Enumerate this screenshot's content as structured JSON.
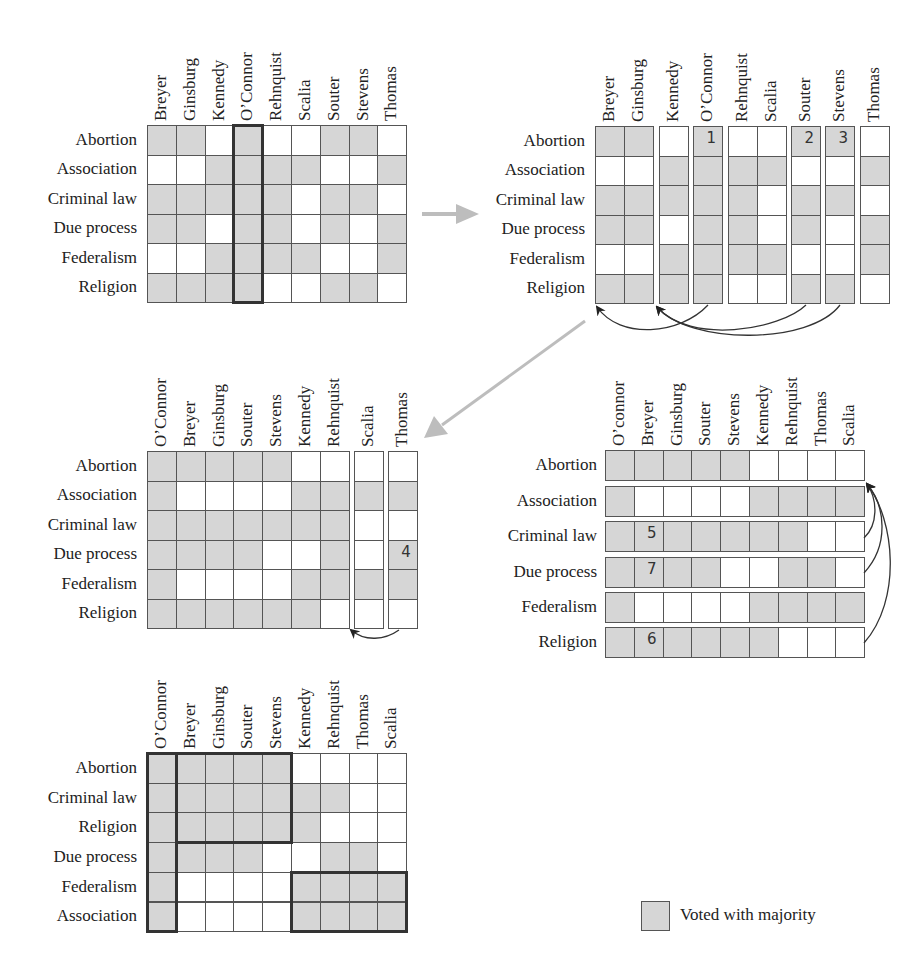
{
  "colors": {
    "majority": "#d6d6d6",
    "minority": "#ffffff",
    "grid": "#555555",
    "flow_arrow": "#b8b8b8",
    "link_arrow": "#333333"
  },
  "legend": {
    "label": "Voted with majority",
    "swatch": "majority"
  },
  "matrices": [
    {
      "id": "step1-original",
      "columns": [
        "Breyer",
        "Ginsburg",
        "Kennedy",
        "O’Connor",
        "Rehnquist",
        "Scalia",
        "Souter",
        "Stevens",
        "Thomas"
      ],
      "rows": [
        "Abortion",
        "Association",
        "Criminal law",
        "Due process",
        "Federalism",
        "Religion"
      ],
      "cells": [
        [
          1,
          1,
          0,
          1,
          0,
          0,
          1,
          1,
          0
        ],
        [
          0,
          0,
          1,
          1,
          1,
          1,
          0,
          0,
          1
        ],
        [
          1,
          1,
          1,
          1,
          1,
          0,
          1,
          1,
          0
        ],
        [
          1,
          1,
          0,
          1,
          1,
          0,
          1,
          0,
          1
        ],
        [
          0,
          0,
          1,
          1,
          1,
          1,
          0,
          0,
          1
        ],
        [
          1,
          1,
          1,
          1,
          0,
          0,
          1,
          1,
          0
        ]
      ],
      "highlight": "O’Connor column"
    },
    {
      "id": "step2-split-columns",
      "columns": [
        "Breyer",
        "Ginsburg",
        "Kennedy",
        "O’Connor",
        "Rehnquist",
        "Scalia",
        "Souter",
        "Stevens",
        "Thomas"
      ],
      "column_groups": [
        [
          "Breyer",
          "Ginsburg"
        ],
        [
          "Kennedy"
        ],
        [
          "O’Connor"
        ],
        [
          "Rehnquist",
          "Scalia"
        ],
        [
          "Souter"
        ],
        [
          "Stevens"
        ],
        [
          "Thomas"
        ]
      ],
      "rows": [
        "Abortion",
        "Association",
        "Criminal law",
        "Due process",
        "Federalism",
        "Religion"
      ],
      "cells": [
        [
          1,
          1,
          0,
          1,
          0,
          0,
          1,
          1,
          0
        ],
        [
          0,
          0,
          1,
          1,
          1,
          1,
          0,
          0,
          1
        ],
        [
          1,
          1,
          1,
          1,
          1,
          0,
          1,
          1,
          0
        ],
        [
          1,
          1,
          0,
          1,
          1,
          0,
          1,
          0,
          1
        ],
        [
          0,
          0,
          1,
          1,
          1,
          1,
          0,
          0,
          1
        ],
        [
          1,
          1,
          1,
          1,
          0,
          0,
          1,
          1,
          0
        ]
      ],
      "markers": [
        {
          "label": "1",
          "row": 0,
          "col": 3
        },
        {
          "label": "2",
          "row": 0,
          "col": 6
        },
        {
          "label": "3",
          "row": 0,
          "col": 7
        }
      ]
    },
    {
      "id": "step3-reordered-columns",
      "columns": [
        "O’Connor",
        "Breyer",
        "Ginsburg",
        "Souter",
        "Stevens",
        "Kennedy",
        "Rehnquist",
        "Scalia",
        "Thomas"
      ],
      "column_groups": [
        [
          "O’Connor",
          "Breyer",
          "Ginsburg",
          "Souter",
          "Stevens",
          "Kennedy",
          "Rehnquist"
        ],
        [
          "Scalia"
        ],
        [
          "Thomas"
        ]
      ],
      "rows": [
        "Abortion",
        "Association",
        "Criminal law",
        "Due process",
        "Federalism",
        "Religion"
      ],
      "cells": [
        [
          1,
          1,
          1,
          1,
          1,
          0,
          0,
          0,
          0
        ],
        [
          1,
          0,
          0,
          0,
          0,
          1,
          1,
          1,
          1
        ],
        [
          1,
          1,
          1,
          1,
          1,
          1,
          1,
          0,
          0
        ],
        [
          1,
          1,
          1,
          1,
          0,
          0,
          1,
          0,
          1
        ],
        [
          1,
          0,
          0,
          0,
          0,
          1,
          1,
          1,
          1
        ],
        [
          1,
          1,
          1,
          1,
          1,
          1,
          0,
          0,
          0
        ]
      ],
      "markers": [
        {
          "label": "4",
          "row": 3,
          "col": 8
        }
      ]
    },
    {
      "id": "step4-split-rows",
      "columns": [
        "O’connor",
        "Breyer",
        "Ginsburg",
        "Souter",
        "Stevens",
        "Kennedy",
        "Rehnquist",
        "Thomas",
        "Scalia"
      ],
      "rows": [
        "Abortion",
        "Association",
        "Criminal law",
        "Due process",
        "Federalism",
        "Religion"
      ],
      "cells": [
        [
          1,
          1,
          1,
          1,
          1,
          0,
          0,
          0,
          0
        ],
        [
          1,
          0,
          0,
          0,
          0,
          1,
          1,
          1,
          1
        ],
        [
          1,
          1,
          1,
          1,
          1,
          1,
          1,
          0,
          0
        ],
        [
          1,
          1,
          1,
          1,
          0,
          0,
          1,
          1,
          0
        ],
        [
          1,
          0,
          0,
          0,
          0,
          1,
          1,
          1,
          1
        ],
        [
          1,
          1,
          1,
          1,
          1,
          1,
          0,
          0,
          0
        ]
      ],
      "markers": [
        {
          "label": "5",
          "row": 2,
          "col": 1
        },
        {
          "label": "7",
          "row": 3,
          "col": 1
        },
        {
          "label": "6",
          "row": 5,
          "col": 1
        }
      ]
    },
    {
      "id": "step5-final",
      "columns": [
        "O’Connor",
        "Breyer",
        "Ginsburg",
        "Souter",
        "Stevens",
        "Kennedy",
        "Rehnquist",
        "Thomas",
        "Scalia"
      ],
      "rows": [
        "Abortion",
        "Criminal law",
        "Religion",
        "Due process",
        "Federalism",
        "Association"
      ],
      "cells": [
        [
          1,
          1,
          1,
          1,
          1,
          0,
          0,
          0,
          0
        ],
        [
          1,
          1,
          1,
          1,
          1,
          1,
          1,
          0,
          0
        ],
        [
          1,
          1,
          1,
          1,
          1,
          1,
          0,
          0,
          0
        ],
        [
          1,
          1,
          1,
          1,
          0,
          0,
          1,
          1,
          0
        ],
        [
          1,
          0,
          0,
          0,
          0,
          1,
          1,
          1,
          1
        ],
        [
          1,
          0,
          0,
          0,
          0,
          1,
          1,
          1,
          1
        ]
      ],
      "blocks": [
        {
          "name": "O’Connor column",
          "rows": [
            0,
            5
          ],
          "cols": [
            0,
            0
          ]
        },
        {
          "name": "Liberal bloc",
          "rows": [
            0,
            2
          ],
          "cols": [
            1,
            4
          ]
        },
        {
          "name": "Conservative bloc",
          "rows": [
            4,
            5
          ],
          "cols": [
            5,
            8
          ]
        }
      ]
    }
  ]
}
